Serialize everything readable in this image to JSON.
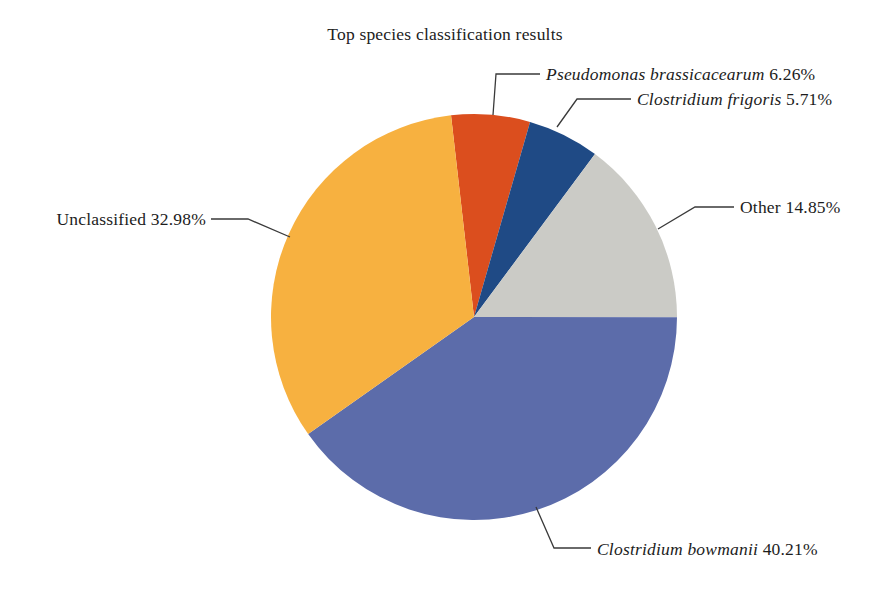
{
  "figure": {
    "title": "Top species classification results"
  },
  "chart_data": {
    "type": "pie",
    "title": "Top species classification results",
    "direction": "clockwise",
    "start_angle_deg_from_top": -6.5,
    "center": [
      474,
      317
    ],
    "radius": 203,
    "leader_color": "#3a3a3a",
    "text_color": "#1c1c1c",
    "background": "#ffffff",
    "slices": [
      {
        "label": "Pseudomonas brassicacearum",
        "pct_label": "6.26%",
        "value": 6.26,
        "color": "#DB4E1E",
        "italic": true,
        "label_anchor": "left",
        "label_x": 546,
        "label_y": 74,
        "leader": [
          [
            493,
            115
          ],
          [
            496,
            74
          ],
          [
            540,
            74
          ]
        ]
      },
      {
        "label": "Clostridium frigoris",
        "pct_label": "5.71%",
        "value": 5.71,
        "color": "#1F4A85",
        "italic": true,
        "label_anchor": "left",
        "label_x": 637,
        "label_y": 99,
        "leader": [
          [
            557,
            127
          ],
          [
            577,
            99
          ],
          [
            631,
            99
          ]
        ]
      },
      {
        "label": "Other",
        "pct_label": "14.85%",
        "value": 14.85,
        "color": "#CBCBC6",
        "italic": false,
        "label_anchor": "left",
        "label_x": 740,
        "label_y": 207,
        "leader": [
          [
            658,
            229
          ],
          [
            695,
            207
          ],
          [
            734,
            207
          ]
        ]
      },
      {
        "label": "Clostridium bowmanii",
        "pct_label": "40.21%",
        "value": 40.21,
        "color": "#5C6CAA",
        "italic": true,
        "label_anchor": "left",
        "label_x": 597,
        "label_y": 549,
        "leader": [
          [
            536,
            507
          ],
          [
            554,
            548
          ],
          [
            591,
            548
          ]
        ]
      },
      {
        "label": "Unclassified",
        "pct_label": "32.98%",
        "value": 32.98,
        "color": "#F7B140",
        "italic": false,
        "label_anchor": "right",
        "label_x": 206,
        "label_y": 219,
        "leader": [
          [
            211,
            219
          ],
          [
            248,
            219
          ],
          [
            290,
            237
          ]
        ]
      }
    ]
  }
}
